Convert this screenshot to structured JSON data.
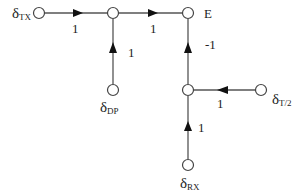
{
  "diagram": {
    "type": "signal-flow-graph",
    "nodes": [
      {
        "id": "tx",
        "label": "δ",
        "sub": "TX",
        "x": 39,
        "y": 13
      },
      {
        "id": "j1",
        "label": "",
        "sub": "",
        "x": 113,
        "y": 13
      },
      {
        "id": "E",
        "label": "E",
        "sub": "",
        "x": 188,
        "y": 13
      },
      {
        "id": "dp",
        "label": "δ",
        "sub": "DP",
        "x": 113,
        "y": 90
      },
      {
        "id": "j2",
        "label": "",
        "sub": "",
        "x": 188,
        "y": 90
      },
      {
        "id": "t2",
        "label": "δ",
        "sub": "T/2",
        "x": 261,
        "y": 90
      },
      {
        "id": "rx",
        "label": "δ",
        "sub": "RX",
        "x": 188,
        "y": 165
      }
    ],
    "edges": [
      {
        "from": "tx",
        "to": "j1",
        "gain": "1"
      },
      {
        "from": "j1",
        "to": "E",
        "gain": "1"
      },
      {
        "from": "dp",
        "to": "j1",
        "gain": "1"
      },
      {
        "from": "j2",
        "to": "E",
        "gain": "-1"
      },
      {
        "from": "t2",
        "to": "j2",
        "gain": "1"
      },
      {
        "from": "rx",
        "to": "j2",
        "gain": "1"
      }
    ],
    "labels": {
      "tx_main": "δ",
      "tx_sub": "TX",
      "E": "E",
      "dp_main": "δ",
      "dp_sub": "DP",
      "t2_main": "δ",
      "t2_sub": "T/2",
      "rx_main": "δ",
      "rx_sub": "RX",
      "gain_tx_j1": "1",
      "gain_j1_E": "1",
      "gain_dp_j1": "1",
      "gain_j2_E": "-1",
      "gain_t2_j2": "1",
      "gain_rx_j2": "1"
    },
    "colors": {
      "line": "#555555",
      "arrow": "#111111",
      "node_fill": "#ffffff",
      "node_stroke": "#444444"
    }
  }
}
